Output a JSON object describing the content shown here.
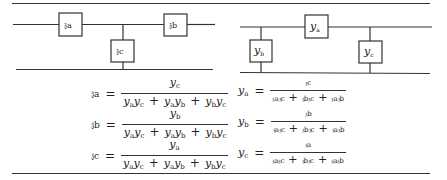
{
  "left_network": {
    "type": "T (star) network",
    "elements": [
      {
        "id": "za",
        "label": "𝔷a",
        "position": "series-left"
      },
      {
        "id": "zb",
        "label": "𝔷b",
        "position": "series-right"
      },
      {
        "id": "zc",
        "label": "𝔷c",
        "position": "shunt"
      }
    ],
    "equations": [
      {
        "lhs": "𝔷a",
        "eq": "=",
        "num": [
          "y",
          "c"
        ],
        "den": [
          [
            "y",
            "a",
            "y",
            "c"
          ],
          [
            "y",
            "a",
            "y",
            "b"
          ],
          [
            "y",
            "b",
            "y",
            "c"
          ]
        ]
      },
      {
        "lhs": "𝔷b",
        "eq": "=",
        "num": [
          "y",
          "b"
        ],
        "den": [
          [
            "y",
            "a",
            "y",
            "c"
          ],
          [
            "y",
            "a",
            "y",
            "b"
          ],
          [
            "y",
            "b",
            "y",
            "c"
          ]
        ]
      },
      {
        "lhs": "𝔷c",
        "eq": "=",
        "num": [
          "y",
          "a"
        ],
        "den": [
          [
            "y",
            "a",
            "y",
            "c"
          ],
          [
            "y",
            "a",
            "y",
            "b"
          ],
          [
            "y",
            "b",
            "y",
            "c"
          ]
        ]
      }
    ]
  },
  "right_network": {
    "type": "Pi (delta) network",
    "elements": [
      {
        "id": "ya",
        "label": "y",
        "sub": "a",
        "position": "series"
      },
      {
        "id": "yb",
        "label": "y",
        "sub": "b",
        "position": "shunt-left"
      },
      {
        "id": "yc",
        "label": "y",
        "sub": "c",
        "position": "shunt-right"
      }
    ],
    "equations": [
      {
        "lhs": "y",
        "lhs_sub": "a",
        "eq": "=",
        "num": "𝔷c",
        "den": [
          "𝔷a𝔷c",
          "𝔷b𝔷c",
          "𝔷a𝔷b"
        ]
      },
      {
        "lhs": "y",
        "lhs_sub": "b",
        "eq": "=",
        "num": "𝔷b",
        "den": [
          "𝔷a𝔷c",
          "𝔷b𝔷c",
          "𝔷a𝔷b"
        ]
      },
      {
        "lhs": "y",
        "lhs_sub": "c",
        "eq": "=",
        "num": "𝔷a",
        "den": [
          "𝔷a𝔷c",
          "𝔷b𝔷c",
          "𝔷a𝔷b"
        ]
      }
    ]
  },
  "symbols": {
    "plus": "+",
    "equals": "="
  }
}
